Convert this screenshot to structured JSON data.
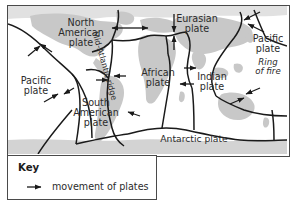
{
  "figure": {
    "type": "map-diagram"
  },
  "map": {
    "ocean_color": "#ffffff",
    "land_color": "#c9c9c9",
    "line_color": "#1a1a1a",
    "frame_color": "#4a4a4a",
    "plate_labels": [
      {
        "id": "north-american",
        "text": "North\nAmerican\nplate"
      },
      {
        "id": "pacific-west",
        "text": "Pacific\nplate"
      },
      {
        "id": "south-american",
        "text": "South\nAmerican\nplate"
      },
      {
        "id": "african",
        "text": "African\nplate"
      },
      {
        "id": "eurasian",
        "text": "Eurasian\nplate"
      },
      {
        "id": "indian",
        "text": "Indian\nplate"
      },
      {
        "id": "pacific-east",
        "text": "Pacific\nplate"
      },
      {
        "id": "antarctic",
        "text": "Antarctic plate"
      }
    ],
    "feature_labels": [
      {
        "id": "mid-atlantic-ridge",
        "text": "Mid-Atlantic ridge",
        "style": "rotated"
      },
      {
        "id": "ring-of-fire",
        "text": "Ring\nof fire",
        "style": "italic"
      }
    ]
  },
  "labels": {
    "north_american_l1": "North",
    "north_american_l2": "American",
    "north_american_l3": "plate",
    "pacific_west_l1": "Pacific",
    "pacific_west_l2": "plate",
    "south_american_l1": "South",
    "south_american_l2": "American",
    "south_american_l3": "plate",
    "african_l1": "African",
    "african_l2": "plate",
    "eurasian_l1": "Eurasian",
    "eurasian_l2": "plate",
    "indian_l1": "Indian",
    "indian_l2": "plate",
    "pacific_east_l1": "Pacific",
    "pacific_east_l2": "plate",
    "ring_of_fire_l1": "Ring",
    "ring_of_fire_l2": "of fire",
    "antarctic": "Antarctic plate",
    "mid_atlantic_ridge": "Mid-Atlantic ridge"
  },
  "key": {
    "title": "Key",
    "entry_label": "movement of plates",
    "entry_symbol": "arrow-right-icon"
  }
}
